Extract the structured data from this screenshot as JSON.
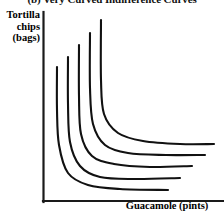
{
  "figure": {
    "panel_title": "(b) Very Curved Indifference Curves",
    "y_axis_label_lines": [
      "Tortilla",
      "chips",
      "(bags)"
    ],
    "x_axis_label": "Guacamole (pints)",
    "line_color": "#111111",
    "axis_color": "#1a1a1a",
    "background_color": "#ffffff"
  },
  "chart_data": {
    "type": "line",
    "title": "(b) Very Curved Indifference Curves",
    "xlabel": "Guacamole (pints)",
    "ylabel": "Tortilla chips (bags)",
    "grid": false,
    "legend": "none",
    "axis_origin_px": [
      43,
      202
    ],
    "x_axis_end_px": [
      224,
      202
    ],
    "y_axis_top_px": [
      43,
      12
    ],
    "xlim": [
      0,
      10
    ],
    "ylim": [
      0,
      10
    ],
    "note": "Five sharply curved (near L-shaped / Leontief-style) indifference curves, convex to the origin, each further from the origin than the last. No tick marks or numeric scale shown.",
    "series": [
      {
        "name": "IC1 (innermost)",
        "path_px": [
          [
            57,
            67
          ],
          [
            57,
            110
          ],
          [
            59,
            145
          ],
          [
            68,
            173
          ],
          [
            88,
            185
          ],
          [
            120,
            189
          ],
          [
            168,
            190
          ]
        ]
      },
      {
        "name": "IC2",
        "path_px": [
          [
            68,
            57
          ],
          [
            68,
            104
          ],
          [
            70,
            142
          ],
          [
            80,
            166
          ],
          [
            100,
            177
          ],
          [
            135,
            179
          ],
          [
            180,
            178
          ]
        ]
      },
      {
        "name": "IC3",
        "path_px": [
          [
            79,
            45
          ],
          [
            79,
            96
          ],
          [
            81,
            134
          ],
          [
            92,
            156
          ],
          [
            114,
            164
          ],
          [
            150,
            167
          ],
          [
            192,
            166
          ]
        ]
      },
      {
        "name": "IC4",
        "path_px": [
          [
            90,
            33
          ],
          [
            90,
            88
          ],
          [
            93,
            124
          ],
          [
            105,
            145
          ],
          [
            128,
            153
          ],
          [
            166,
            155
          ],
          [
            205,
            155
          ]
        ]
      },
      {
        "name": "IC5 (outermost)",
        "path_px": [
          [
            101,
            20
          ],
          [
            101,
            80
          ],
          [
            104,
            114
          ],
          [
            118,
            133
          ],
          [
            143,
            141
          ],
          [
            180,
            144
          ],
          [
            214,
            144
          ]
        ]
      }
    ]
  }
}
